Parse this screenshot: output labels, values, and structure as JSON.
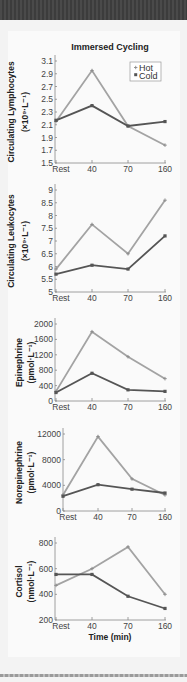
{
  "colors": {
    "hot": "#a3a3a3",
    "cold": "#555555",
    "axis": "#888888"
  },
  "chart_data": [
    {
      "type": "line",
      "title": "Immersed Cycling",
      "ylabel": "Circulating Lymphocytes (×10⁹·L⁻¹)",
      "ylabel_lines": [
        "Circulating Lymphocytes",
        "(×10⁹·L⁻¹)"
      ],
      "xlabel": "",
      "categories": [
        "Rest",
        "40",
        "70",
        "160"
      ],
      "yticks": [
        "1.5",
        "1.7",
        "1.9",
        "2.1",
        "2.3",
        "2.5",
        "2.7",
        "2.9",
        "3.1"
      ],
      "ylim": [
        1.5,
        3.1
      ],
      "legend": [
        "Hot",
        "Cold"
      ],
      "series": [
        {
          "name": "Hot",
          "values": [
            2.15,
            2.95,
            2.08,
            1.78
          ]
        },
        {
          "name": "Cold",
          "values": [
            2.17,
            2.4,
            2.08,
            2.15
          ]
        }
      ]
    },
    {
      "type": "line",
      "ylabel": "Circulating Leukocytes (×10⁹·L⁻¹)",
      "ylabel_lines": [
        "Circulating Leukocytes",
        "(×10⁹·L⁻¹)"
      ],
      "categories": [
        "Rest",
        "40",
        "70",
        "160"
      ],
      "yticks": [
        "5",
        "5.5",
        "6",
        "6.5",
        "7",
        "7.5",
        "8",
        "8.5",
        "9"
      ],
      "ylim": [
        5,
        9
      ],
      "series": [
        {
          "name": "Hot",
          "values": [
            5.9,
            7.65,
            6.5,
            8.6
          ]
        },
        {
          "name": "Cold",
          "values": [
            5.7,
            6.05,
            5.9,
            7.2
          ]
        }
      ]
    },
    {
      "type": "line",
      "ylabel": "Epinephrine (pmol·L⁻¹)",
      "ylabel_lines": [
        "Epinephrine",
        "(pmol·L⁻¹)"
      ],
      "categories": [
        "Rest",
        "40",
        "70",
        "160"
      ],
      "yticks": [
        "0",
        "400",
        "800",
        "1200",
        "1600",
        "2000"
      ],
      "ylim": [
        0,
        2000
      ],
      "series": [
        {
          "name": "Hot",
          "values": [
            250,
            1800,
            1150,
            580
          ]
        },
        {
          "name": "Cold",
          "values": [
            220,
            720,
            290,
            250
          ]
        }
      ]
    },
    {
      "type": "line",
      "ylabel": "Norepinephrine (pmol·L⁻¹)",
      "ylabel_lines": [
        "Norepinephrine",
        "(pmol·L⁻¹)"
      ],
      "categories": [
        "Rest",
        "40",
        "70",
        "160"
      ],
      "yticks": [
        "0",
        "4000",
        "8000",
        "12000"
      ],
      "ylim": [
        0,
        12000
      ],
      "series": [
        {
          "name": "Hot",
          "values": [
            2500,
            11600,
            5000,
            2500
          ]
        },
        {
          "name": "Cold",
          "values": [
            2300,
            4100,
            3400,
            2800
          ]
        }
      ]
    },
    {
      "type": "line",
      "ylabel": "Cortisol (nmol·L⁻¹)",
      "ylabel_lines": [
        "Cortisol",
        "(nmol·L⁻¹)"
      ],
      "xlabel": "Time (min)",
      "categories": [
        "Rest",
        "40",
        "70",
        "160"
      ],
      "yticks": [
        "200",
        "400",
        "600",
        "800"
      ],
      "ylim": [
        200,
        800
      ],
      "series": [
        {
          "name": "Hot",
          "values": [
            470,
            600,
            770,
            400
          ]
        },
        {
          "name": "Cold",
          "values": [
            555,
            555,
            385,
            290
          ]
        }
      ]
    }
  ],
  "layout": [
    {
      "ax": 55,
      "top": 61,
      "bottom": 163,
      "x": [
        56,
        92,
        128,
        165
      ],
      "yl": 14,
      "yr": 28
    },
    {
      "ax": 55,
      "top": 190,
      "bottom": 292,
      "x": [
        56,
        92,
        128,
        165
      ],
      "yl": 14,
      "yr": 28
    },
    {
      "ax": 55,
      "top": 324,
      "bottom": 401,
      "x": [
        56,
        92,
        128,
        165
      ],
      "yl": 22,
      "yr": 34
    },
    {
      "ax": 63,
      "top": 434,
      "bottom": 511,
      "x": [
        63,
        98,
        132,
        165
      ],
      "yl": 22,
      "yr": 34
    },
    {
      "ax": 55,
      "top": 543,
      "bottom": 620,
      "x": [
        56,
        92,
        128,
        165
      ],
      "yl": 22,
      "yr": 34
    }
  ]
}
